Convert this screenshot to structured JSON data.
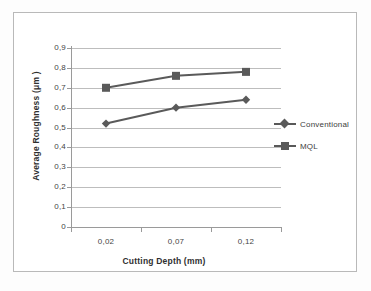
{
  "chart_data": {
    "type": "line",
    "title": "",
    "xlabel": "Cutting Depth (mm)",
    "ylabel": "Average Roughness  (μm )",
    "categories": [
      "0,02",
      "0,07",
      "0,12"
    ],
    "x_values": [
      0.02,
      0.07,
      0.12
    ],
    "ylim": [
      0,
      0.9
    ],
    "y_ticks": [
      "0",
      "0,1",
      "0,2",
      "0,3",
      "0,4",
      "0,5",
      "0,6",
      "0,7",
      "0,8",
      "0,9"
    ],
    "y_tick_values": [
      0,
      0.1,
      0.2,
      0.3,
      0.4,
      0.5,
      0.6,
      0.7,
      0.8,
      0.9
    ],
    "grid": true,
    "legend_position": "right",
    "series": [
      {
        "name": "Conventional",
        "marker": "diamond",
        "color": "#5a5a5a",
        "values": [
          0.52,
          0.6,
          0.64
        ]
      },
      {
        "name": "MQL",
        "marker": "square",
        "color": "#5a5a5a",
        "values": [
          0.7,
          0.76,
          0.78
        ]
      }
    ]
  },
  "legend": {
    "entries": [
      {
        "label": "Conventional",
        "marker": "diamond-marker-icon"
      },
      {
        "label": "MQL",
        "marker": "square-marker-icon"
      }
    ]
  },
  "colors": {
    "series_line": "#5a5a5a",
    "gridline": "#bdbdbd",
    "axis": "#9a9a9a",
    "frame": "#b9b9b9",
    "text": "#3a3a3a",
    "background": "#ffffff"
  }
}
